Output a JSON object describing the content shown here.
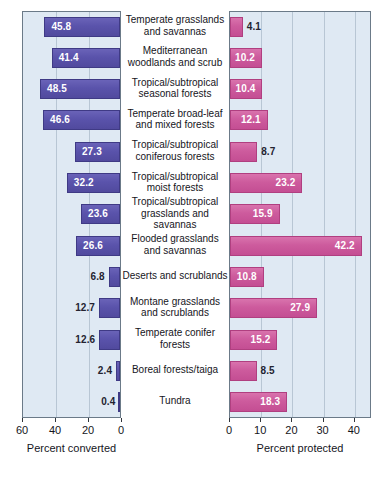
{
  "chart_data": {
    "type": "bar",
    "orientation": "horizontal",
    "layout": "paired back-to-back panels",
    "categories": [
      "Temperate grasslands and savannas",
      "Mediterranean woodlands and scrub",
      "Tropical/subtropical seasonal forests",
      "Temperate broad-leaf and mixed forests",
      "Tropical/subtropical coniferous forests",
      "Tropical/subtropical moist forests",
      "Tropical/subtropical grasslands and savannas",
      "Flooded grasslands and savannas",
      "Deserts and scrublands",
      "Montane grasslands and scrublands",
      "Temperate conifer forests",
      "Boreal forests/taiga",
      "Tundra"
    ],
    "series": [
      {
        "name": "Percent converted",
        "panel": "left",
        "direction": "right-to-left",
        "color": "#5a53ab",
        "values": [
          45.8,
          41.4,
          48.5,
          46.6,
          27.3,
          32.2,
          23.6,
          26.6,
          6.8,
          12.7,
          12.6,
          2.4,
          0.4
        ],
        "xlabel": "Percent converted",
        "ticks": [
          60,
          40,
          20,
          0
        ],
        "xlim": [
          60,
          0
        ]
      },
      {
        "name": "Percent protected",
        "panel": "right",
        "direction": "left-to-right",
        "color": "#cd5b9d",
        "values": [
          4.1,
          10.2,
          10.4,
          12.1,
          8.7,
          23.2,
          15.9,
          42.2,
          10.8,
          27.9,
          15.2,
          8.5,
          18.3
        ],
        "xlabel": "Percent protected",
        "ticks": [
          0,
          10,
          20,
          30,
          40
        ],
        "xlim": [
          0,
          45.5
        ]
      }
    ],
    "grid": true,
    "legend": "none",
    "title": "",
    "plot_background": "#dfe9f3"
  },
  "labels": {
    "category_lines": [
      [
        "Temperate grasslands",
        "and savannas"
      ],
      [
        "Mediterranean",
        "woodlands and scrub"
      ],
      [
        "Tropical/subtropical",
        "seasonal forests"
      ],
      [
        "Temperate broad-leaf",
        "and mixed forests"
      ],
      [
        "Tropical/subtropical",
        "coniferous forests"
      ],
      [
        "Tropical/subtropical",
        "moist forests"
      ],
      [
        "Tropical/subtropical",
        "grasslands and savannas"
      ],
      [
        "Flooded grasslands",
        "and savannas"
      ],
      [
        "Deserts and scrublands"
      ],
      [
        "Montane grasslands",
        "and scrublands"
      ],
      [
        "Temperate conifer",
        "forests"
      ],
      [
        "Boreal forests/taiga"
      ],
      [
        "Tundra"
      ]
    ]
  },
  "left_axis": {
    "title": "Percent converted",
    "tick_labels": [
      "60",
      "40",
      "20",
      "0"
    ]
  },
  "right_axis": {
    "title": "Percent protected",
    "tick_labels": [
      "0",
      "10",
      "20",
      "30",
      "40"
    ]
  },
  "left_values": [
    "45.8",
    "41.4",
    "48.5",
    "46.6",
    "27.3",
    "32.2",
    "23.6",
    "26.6",
    "6.8",
    "12.7",
    "12.6",
    "2.4",
    "0.4"
  ],
  "right_values": [
    "4.1",
    "10.2",
    "10.4",
    "12.1",
    "8.7",
    "23.2",
    "15.9",
    "42.2",
    "10.8",
    "27.9",
    "15.2",
    "8.5",
    "18.3"
  ],
  "colors": {
    "left_bar": "#5a53ab",
    "right_bar": "#cd5b9d",
    "plot_bg": "#dfe9f3",
    "frame": "#6b7a88",
    "gridline": "#b8c6d4"
  }
}
